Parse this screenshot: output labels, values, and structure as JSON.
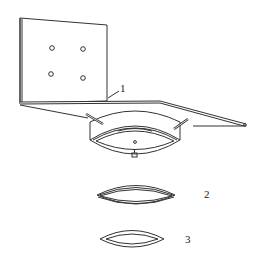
{
  "diagram": {
    "type": "technical-drawing",
    "labels": [
      {
        "id": "1",
        "text": "1",
        "refers_to": "angle bracket plate"
      },
      {
        "id": "2",
        "text": "2",
        "refers_to": "double ring component"
      },
      {
        "id": "3",
        "text": "3",
        "refers_to": "single ring component"
      }
    ],
    "colors": {
      "stroke": "#333333",
      "background": "#ffffff"
    }
  }
}
